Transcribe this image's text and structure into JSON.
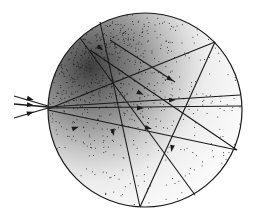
{
  "diagram": {
    "title": "",
    "type": "ray-tracing-in-sphere",
    "colors": {
      "background": "#ffffff",
      "ink": "#1a1a1a",
      "stipple": "#222222"
    },
    "sphere": {
      "cx": 145,
      "cy": 110,
      "r": 97
    },
    "incoming_rays": [
      {
        "x1": 14,
        "y1": 96,
        "x2": 48,
        "y2": 106
      },
      {
        "x1": 14,
        "y1": 104,
        "x2": 48,
        "y2": 107
      },
      {
        "x1": 14,
        "y1": 118,
        "x2": 48,
        "y2": 108
      }
    ],
    "internal_rays": [
      {
        "x1": 48,
        "y1": 107,
        "x2": 240,
        "y2": 95
      },
      {
        "x1": 48,
        "y1": 108,
        "x2": 242,
        "y2": 106
      },
      {
        "x1": 48,
        "y1": 109,
        "x2": 215,
        "y2": 42
      },
      {
        "x1": 48,
        "y1": 110,
        "x2": 237,
        "y2": 150
      },
      {
        "x1": 80,
        "y1": 38,
        "x2": 195,
        "y2": 195
      },
      {
        "x1": 100,
        "y1": 22,
        "x2": 140,
        "y2": 207
      },
      {
        "x1": 215,
        "y1": 42,
        "x2": 140,
        "y2": 207
      },
      {
        "x1": 237,
        "y1": 150,
        "x2": 90,
        "y2": 50
      },
      {
        "x1": 110,
        "y1": 40,
        "x2": 175,
        "y2": 82
      }
    ],
    "arrowheads": [
      {
        "x": 30,
        "y": 99,
        "angle": 16
      },
      {
        "x": 30,
        "y": 105,
        "angle": 5
      },
      {
        "x": 30,
        "y": 113,
        "angle": -17
      },
      {
        "x": 170,
        "y": 79,
        "angle": 33
      },
      {
        "x": 140,
        "y": 93,
        "angle": 25
      },
      {
        "x": 140,
        "y": 108,
        "angle": 0
      },
      {
        "x": 148,
        "y": 128,
        "angle": 12
      },
      {
        "x": 172,
        "y": 100,
        "angle": -3
      },
      {
        "x": 113,
        "y": 132,
        "angle": 78
      },
      {
        "x": 75,
        "y": 128,
        "angle": -20
      },
      {
        "x": 100,
        "y": 48,
        "angle": 35
      },
      {
        "x": 172,
        "y": 148,
        "angle": 100
      }
    ]
  }
}
